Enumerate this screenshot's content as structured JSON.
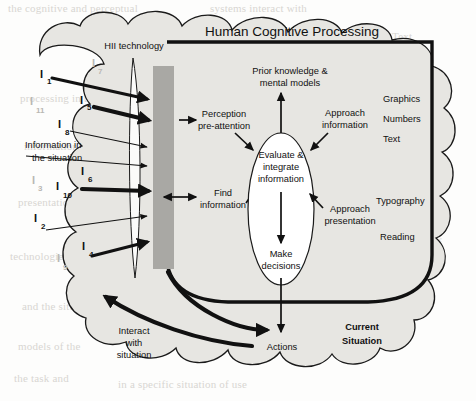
{
  "figure": {
    "title": "Human Cognitive Processing",
    "current_situation": "Current\nSituation",
    "current_situation_line1": "Current",
    "current_situation_line2": "Situation"
  },
  "cloud": {
    "source_label_line1": "Information in",
    "source_label_line2": "the situation",
    "technology_label": "HII technology",
    "interact_line1": "Interact",
    "interact_line2": "with",
    "interact_line3": "situation"
  },
  "information_items": [
    {
      "base": "I",
      "sub": "1",
      "state": "active"
    },
    {
      "base": "I",
      "sub": "7",
      "state": "faded"
    },
    {
      "base": "I",
      "sub": "5",
      "state": "active"
    },
    {
      "base": "I",
      "sub": "11",
      "state": "faded"
    },
    {
      "base": "I",
      "sub": "8",
      "state": "active"
    },
    {
      "base": "I",
      "sub": "6",
      "state": "active"
    },
    {
      "base": "I",
      "sub": "3",
      "state": "faded"
    },
    {
      "base": "I",
      "sub": "10",
      "state": "active"
    },
    {
      "base": "I",
      "sub": "2",
      "state": "active"
    },
    {
      "base": "I",
      "sub": "4",
      "state": "active"
    },
    {
      "base": "I",
      "sub": "9",
      "state": "faded"
    }
  ],
  "process_nodes": {
    "perception_line1": "Perception",
    "perception_line2": "pre-attention",
    "find_line1": "Find",
    "find_line2": "information",
    "prior_line1": "Prior knowledge &",
    "prior_line2": "mental models",
    "evaluate_line1": "Evaluate &",
    "evaluate_line2": "integrate",
    "evaluate_line3": "information",
    "decisions_line1": "Make",
    "decisions_line2": "decisions",
    "actions": "Actions",
    "approach_info_line1": "Approach",
    "approach_info_line2": "information",
    "approach_pres_line1": "Approach",
    "approach_pres_line2": "presentation"
  },
  "presentation_attributes": {
    "upper": [
      "Graphics",
      "Numbers",
      "Text"
    ],
    "lower": [
      "Typography",
      "Reading"
    ]
  },
  "colors": {
    "cloud_fill": "#e7e6e2",
    "grey_bar": "#a9a8a4",
    "stroke": "#111111",
    "faded_label": "#b9b7b3",
    "page_background": "#fdfdfc"
  },
  "background_ghost_text": [
    {
      "t": "the cognitive and perceptual",
      "x": 8,
      "y": 2
    },
    {
      "t": "systems interact with",
      "x": 210,
      "y": 2
    },
    {
      "t": "Text",
      "x": 392,
      "y": 30
    },
    {
      "t": "for the one kind of information",
      "x": 248,
      "y": 48
    },
    {
      "t": "processing in the situation",
      "x": 20,
      "y": 92
    },
    {
      "t": "and the relation to task",
      "x": 300,
      "y": 84
    },
    {
      "t": "information",
      "x": 24,
      "y": 140
    },
    {
      "t": "as the system",
      "x": 340,
      "y": 150
    },
    {
      "t": "presentation of the",
      "x": 18,
      "y": 196
    },
    {
      "t": "is the way that",
      "x": 345,
      "y": 196
    },
    {
      "t": "technologies",
      "x": 10,
      "y": 250
    },
    {
      "t": "to support the aspects of",
      "x": 330,
      "y": 236
    },
    {
      "t": "of the perceptual and",
      "x": 318,
      "y": 256
    },
    {
      "t": "the properties of all the",
      "x": 318,
      "y": 272
    },
    {
      "t": "and the situation",
      "x": 22,
      "y": 300
    },
    {
      "t": "models of the",
      "x": 18,
      "y": 340
    },
    {
      "t": "a presentation for",
      "x": 320,
      "y": 332
    },
    {
      "t": "in a specific situation of use",
      "x": 118,
      "y": 378
    },
    {
      "t": "the task and",
      "x": 14,
      "y": 372
    }
  ]
}
